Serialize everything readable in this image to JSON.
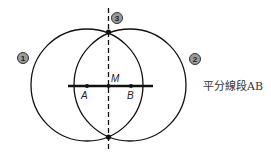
{
  "diagram": {
    "caption": "平分線段AB",
    "points": {
      "A": "A",
      "B": "B",
      "M": "M"
    },
    "steps": [
      "1",
      "2",
      "3"
    ],
    "colors": {
      "stroke": "#111111",
      "badge_fill": "#9a9a9a",
      "badge_stroke": "#333333",
      "text": "#333333"
    }
  }
}
